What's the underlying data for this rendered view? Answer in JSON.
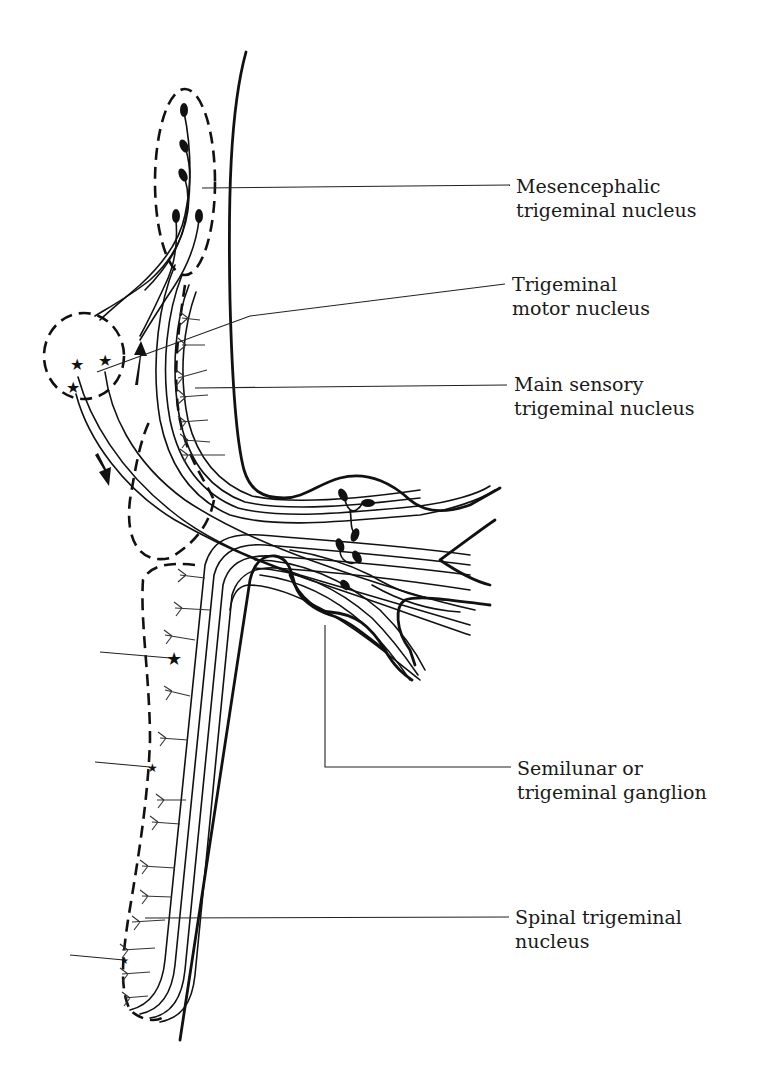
{
  "figure": {
    "labels": [
      {
        "id": "mesencephalic",
        "line1": "Mesencephalic",
        "line2": "trigeminal nucleus"
      },
      {
        "id": "motor",
        "line1": "Trigeminal",
        "line2": "motor nucleus"
      },
      {
        "id": "main-sensory",
        "line1": "Main sensory",
        "line2": "trigeminal nucleus"
      },
      {
        "id": "ganglion",
        "line1": "Semilunar or",
        "line2": "trigeminal ganglion"
      },
      {
        "id": "spinal",
        "line1": "Spinal trigeminal",
        "line2": "nucleus"
      }
    ],
    "colors": {
      "ink": "#111111",
      "background": "#ffffff"
    }
  }
}
